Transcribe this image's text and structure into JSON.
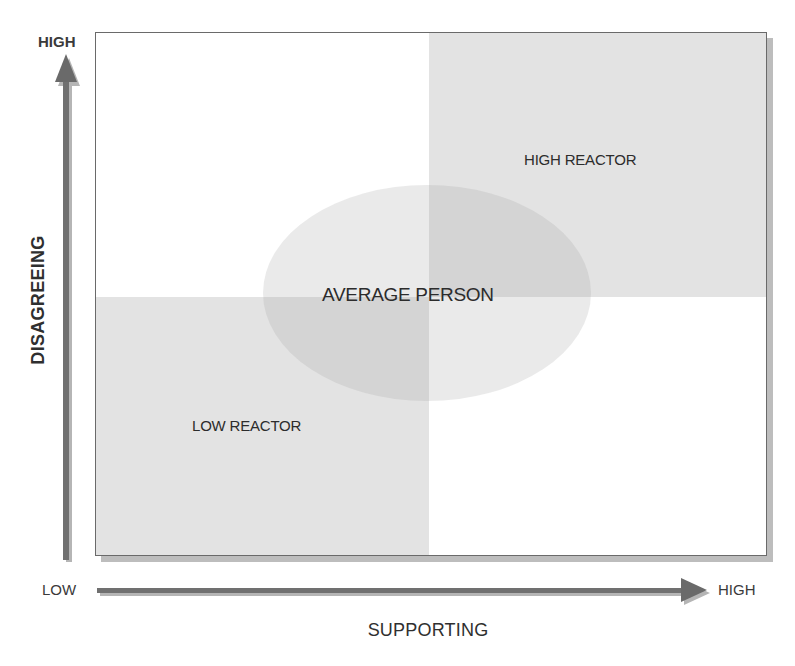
{
  "diagram": {
    "type": "quadrant",
    "y_axis": {
      "title": "DISAGREEING",
      "low_label": "",
      "high_label": "HIGH"
    },
    "x_axis": {
      "title": "SUPPORTING",
      "low_label": "LOW",
      "high_label": "HIGH"
    },
    "quadrants": [
      {
        "position": "top-left",
        "label": "",
        "shaded": false
      },
      {
        "position": "top-right",
        "label": "HIGH REACTOR",
        "shaded": true
      },
      {
        "position": "bottom-left",
        "label": "LOW REACTOR",
        "shaded": true
      },
      {
        "position": "bottom-right",
        "label": "",
        "shaded": false
      }
    ],
    "center": {
      "label": "AVERAGE PERSON",
      "shape": "ellipse"
    },
    "colors": {
      "shaded_quadrant": "#e3e3e3",
      "ellipse": "#c8c8c8",
      "arrow": "#6e6e6e",
      "border": "#6a6a6a",
      "text": "#2c2c2c"
    }
  }
}
